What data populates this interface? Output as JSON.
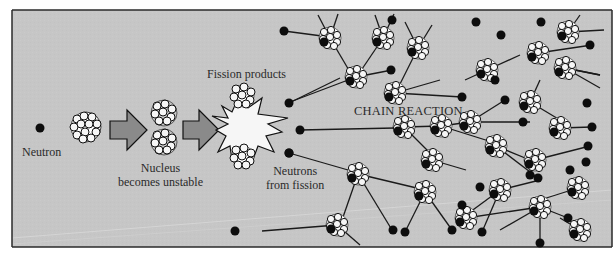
{
  "figure": {
    "colors": {
      "background": "#c7c7c7",
      "frame": "#2a2a2a",
      "neutron": "#0d0d0d",
      "proton_fill": "#f4f4f4",
      "arrow_fill": "#8a8a8a",
      "burst_fill": "#f6f6f6",
      "line": "#1a1a1a"
    },
    "labels": {
      "neutron": "Neutron",
      "nucleus_line1": "Nucleus",
      "nucleus_line2": "becomes unstable",
      "fission_products": "Fission products",
      "neutrons_from_line1": "Neutrons",
      "neutrons_from_line2": "from fission",
      "chain_reaction": "CHAIN REACTION"
    },
    "stages": [
      {
        "id": "incoming-neutron",
        "x": 40,
        "y": 128
      },
      {
        "id": "target-nucleus",
        "x": 86,
        "y": 127
      },
      {
        "id": "arrow-1",
        "x": 110,
        "y": 130
      },
      {
        "id": "unstable-nucleus",
        "x": 164,
        "y": 128
      },
      {
        "id": "arrow-2",
        "x": 183,
        "y": 130
      },
      {
        "id": "fission-burst",
        "x": 245,
        "y": 128
      }
    ],
    "fission_neutrons": [
      {
        "x": 289,
        "y": 103
      },
      {
        "x": 300,
        "y": 130
      },
      {
        "x": 289,
        "y": 153
      }
    ],
    "chain_nuclei": [
      [
        330,
        38
      ],
      [
        383,
        38
      ],
      [
        356,
        77
      ],
      [
        418,
        48
      ],
      [
        395,
        93
      ],
      [
        487,
        70
      ],
      [
        470,
        122
      ],
      [
        404,
        127
      ],
      [
        441,
        126
      ],
      [
        538,
        53
      ],
      [
        568,
        32
      ],
      [
        565,
        68
      ],
      [
        530,
        102
      ],
      [
        560,
        128
      ],
      [
        496,
        146
      ],
      [
        535,
        160
      ],
      [
        432,
        160
      ],
      [
        358,
        174
      ],
      [
        425,
        192
      ],
      [
        500,
        190
      ],
      [
        578,
        188
      ],
      [
        540,
        207
      ],
      [
        466,
        218
      ],
      [
        337,
        225
      ],
      [
        580,
        230
      ]
    ],
    "chain_neutrons": [
      [
        284,
        31
      ],
      [
        392,
        20
      ],
      [
        476,
        22
      ],
      [
        541,
        22
      ],
      [
        501,
        35
      ],
      [
        590,
        45
      ],
      [
        391,
        70
      ],
      [
        462,
        97
      ],
      [
        495,
        80
      ],
      [
        523,
        122
      ],
      [
        505,
        100
      ],
      [
        587,
        103
      ],
      [
        592,
        127
      ],
      [
        588,
        146
      ],
      [
        586,
        162
      ],
      [
        570,
        170
      ],
      [
        538,
        178
      ],
      [
        480,
        187
      ],
      [
        462,
        205
      ],
      [
        482,
        232
      ],
      [
        540,
        243
      ],
      [
        452,
        230
      ],
      [
        405,
        232
      ],
      [
        393,
        230
      ],
      [
        235,
        231
      ],
      [
        568,
        218
      ],
      [
        530,
        175
      ],
      [
        289,
        153
      ]
    ],
    "links": [
      [
        [
          289,
          103
        ],
        [
          340,
          78
        ]
      ],
      [
        [
          300,
          130
        ],
        [
          395,
          128
        ]
      ],
      [
        [
          289,
          153
        ],
        [
          355,
          172
        ]
      ],
      [
        [
          284,
          31
        ],
        [
          322,
          36
        ]
      ],
      [
        [
          330,
          38
        ],
        [
          350,
          72
        ]
      ],
      [
        [
          383,
          38
        ],
        [
          360,
          72
        ]
      ],
      [
        [
          356,
          77
        ],
        [
          392,
          70
        ]
      ],
      [
        [
          356,
          77
        ],
        [
          290,
          102
        ]
      ],
      [
        [
          418,
          48
        ],
        [
          398,
          88
        ]
      ],
      [
        [
          395,
          93
        ],
        [
          462,
          97
        ]
      ],
      [
        [
          395,
          93
        ],
        [
          440,
          80
        ]
      ],
      [
        [
          487,
          70
        ],
        [
          465,
          80
        ]
      ],
      [
        [
          487,
          70
        ],
        [
          520,
          55
        ]
      ],
      [
        [
          404,
          127
        ],
        [
          441,
          126
        ]
      ],
      [
        [
          404,
          127
        ],
        [
          432,
          155
        ]
      ],
      [
        [
          441,
          126
        ],
        [
          470,
          122
        ]
      ],
      [
        [
          441,
          126
        ],
        [
          492,
          142
        ]
      ],
      [
        [
          470,
          122
        ],
        [
          505,
          100
        ]
      ],
      [
        [
          470,
          122
        ],
        [
          530,
          122
        ]
      ],
      [
        [
          530,
          102
        ],
        [
          540,
          80
        ]
      ],
      [
        [
          530,
          102
        ],
        [
          560,
          120
        ]
      ],
      [
        [
          538,
          53
        ],
        [
          592,
          45
        ]
      ],
      [
        [
          565,
          68
        ],
        [
          600,
          75
        ]
      ],
      [
        [
          560,
          128
        ],
        [
          592,
          127
        ]
      ],
      [
        [
          496,
          146
        ],
        [
          538,
          178
        ]
      ],
      [
        [
          496,
          146
        ],
        [
          530,
          160
        ]
      ],
      [
        [
          535,
          160
        ],
        [
          590,
          146
        ]
      ],
      [
        [
          432,
          160
        ],
        [
          466,
          170
        ]
      ],
      [
        [
          358,
          174
        ],
        [
          425,
          190
        ]
      ],
      [
        [
          358,
          174
        ],
        [
          342,
          220
        ]
      ],
      [
        [
          358,
          174
        ],
        [
          392,
          230
        ]
      ],
      [
        [
          425,
          192
        ],
        [
          452,
          230
        ]
      ],
      [
        [
          425,
          192
        ],
        [
          405,
          232
        ]
      ],
      [
        [
          500,
          190
        ],
        [
          466,
          215
        ]
      ],
      [
        [
          500,
          190
        ],
        [
          482,
          232
        ]
      ],
      [
        [
          500,
          190
        ],
        [
          540,
          180
        ]
      ],
      [
        [
          578,
          188
        ],
        [
          540,
          200
        ]
      ],
      [
        [
          540,
          207
        ],
        [
          568,
          218
        ]
      ],
      [
        [
          540,
          207
        ],
        [
          500,
          230
        ]
      ],
      [
        [
          337,
          225
        ],
        [
          262,
          231
        ]
      ],
      [
        [
          337,
          225
        ],
        [
          360,
          245
        ]
      ],
      [
        [
          466,
          218
        ],
        [
          540,
          207
        ]
      ],
      [
        [
          580,
          230
        ],
        [
          560,
          218
        ]
      ],
      [
        [
          540,
          207
        ],
        [
          540,
          243
        ]
      ],
      [
        [
          330,
          38
        ],
        [
          318,
          15
        ]
      ],
      [
        [
          330,
          38
        ],
        [
          338,
          14
        ]
      ],
      [
        [
          383,
          38
        ],
        [
          375,
          15
        ]
      ],
      [
        [
          383,
          38
        ],
        [
          394,
          14
        ]
      ],
      [
        [
          418,
          48
        ],
        [
          405,
          22
        ]
      ],
      [
        [
          418,
          48
        ],
        [
          432,
          25
        ]
      ],
      [
        [
          568,
          32
        ],
        [
          580,
          15
        ]
      ],
      [
        [
          568,
          32
        ],
        [
          604,
          30
        ]
      ],
      [
        [
          565,
          68
        ],
        [
          600,
          75
        ]
      ],
      [
        [
          565,
          68
        ],
        [
          600,
          88
        ]
      ]
    ]
  }
}
